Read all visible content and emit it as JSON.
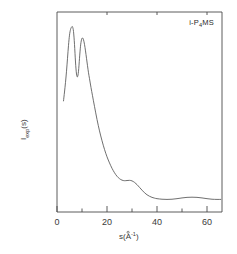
{
  "figure": {
    "sample_label": "i-P4MS",
    "sample_label_main_a": "i-P",
    "sample_label_sub": "4",
    "sample_label_main_b": "MS",
    "background_color": "#ffffff",
    "curve_color": "#555555",
    "axis_color": "#4a4a4a"
  },
  "axes": {
    "x_title_main": "s(A",
    "x_title_sup": "-1",
    "x_title_close": ")",
    "x_title_full": "s(Å⁻¹)",
    "y_title_main_a": "I",
    "y_title_sub": "exp",
    "y_title_main_b": "(s)",
    "y_title_full": "Iexp(s)",
    "x_ticks": [
      "0",
      "20",
      "40",
      "60"
    ],
    "x_tick_values": [
      0,
      20,
      40,
      60
    ],
    "x_minor_tick_values": [
      10,
      30,
      50
    ],
    "y_ticks": [],
    "grid": false
  },
  "chart_data": {
    "type": "line",
    "title": "",
    "subtitle": "",
    "xlabel": "s(Å⁻¹)",
    "ylabel": "Iexp(s)",
    "xlim": [
      0,
      66
    ],
    "ylim": [
      0,
      1.08
    ],
    "grid": false,
    "legend_position": "top-right",
    "annotations": [
      {
        "text": "i-P4MS",
        "x": 57,
        "y": 1.0
      }
    ],
    "series": [
      {
        "name": "i-P4MS",
        "color": "#555555",
        "x": [
          2.6,
          3.0,
          3.4,
          3.8,
          4.2,
          4.6,
          5.0,
          5.4,
          5.8,
          6.2,
          6.6,
          7.0,
          7.4,
          7.8,
          8.2,
          8.6,
          9.0,
          9.4,
          9.8,
          10.2,
          10.6,
          11.0,
          11.4,
          11.8,
          12.2,
          12.6,
          13.0,
          13.6,
          14.2,
          15.0,
          16.0,
          17.0,
          18.0,
          19.0,
          20.0,
          21.0,
          22.0,
          23.0,
          24.0,
          25.0,
          26.0,
          27.0,
          28.0,
          29.0,
          30.0,
          31.0,
          32.0,
          33.0,
          34.0,
          35.0,
          36.0,
          37.0,
          38.0,
          39.0,
          40.0,
          42.0,
          44.0,
          46.0,
          48.0,
          50.0,
          52.0,
          54.0,
          56.0,
          58.0,
          60.0,
          62.0,
          64.0,
          65.5
        ],
        "y": [
          0.6,
          0.648,
          0.7,
          0.76,
          0.83,
          0.9,
          0.955,
          0.985,
          0.998,
          1.0,
          0.975,
          0.905,
          0.81,
          0.745,
          0.73,
          0.76,
          0.83,
          0.895,
          0.93,
          0.94,
          0.93,
          0.905,
          0.87,
          0.83,
          0.79,
          0.752,
          0.72,
          0.672,
          0.628,
          0.57,
          0.5,
          0.438,
          0.385,
          0.338,
          0.298,
          0.265,
          0.236,
          0.212,
          0.193,
          0.18,
          0.172,
          0.169,
          0.17,
          0.171,
          0.168,
          0.16,
          0.148,
          0.133,
          0.118,
          0.104,
          0.093,
          0.085,
          0.079,
          0.075,
          0.072,
          0.069,
          0.068,
          0.069,
          0.072,
          0.076,
          0.079,
          0.08,
          0.079,
          0.076,
          0.072,
          0.069,
          0.068,
          0.068
        ]
      }
    ]
  }
}
